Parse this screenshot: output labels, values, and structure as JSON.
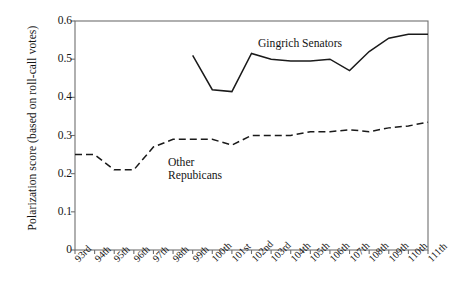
{
  "chart_data": {
    "type": "line",
    "title": "",
    "subtitle": "",
    "xlabel": "",
    "ylabel": "Polarization score (based on roll-call votes)",
    "categories": [
      "93rd",
      "94th",
      "95th",
      "96th",
      "97th",
      "98th",
      "99th",
      "100th",
      "101st",
      "102nd",
      "103rd",
      "104th",
      "105th",
      "106th",
      "107th",
      "108th",
      "109th",
      "110th",
      "111th"
    ],
    "ylim": [
      0,
      0.6
    ],
    "ytick_labels": [
      "0",
      "0.1",
      "0.2",
      "0.3",
      "0.4",
      "0.5",
      "0.6"
    ],
    "ytick_values": [
      0,
      0.1,
      0.2,
      0.3,
      0.4,
      0.5,
      0.6
    ],
    "grid": false,
    "legend_position": "inline-annotation",
    "series": [
      {
        "name": "Gingrich Senators",
        "style": "solid",
        "color": "#1a1a1a",
        "start_category": "99th",
        "x": [
          "99th",
          "100th",
          "101st",
          "102nd",
          "103rd",
          "104th",
          "105th",
          "106th",
          "107th",
          "108th",
          "109th",
          "110th",
          "111th"
        ],
        "values": [
          0.51,
          0.42,
          0.415,
          0.515,
          0.5,
          0.495,
          0.495,
          0.5,
          0.47,
          0.52,
          0.555,
          0.565,
          0.565
        ]
      },
      {
        "name": "Other Repubicans",
        "style": "dashed",
        "color": "#1a1a1a",
        "start_category": "93rd",
        "x": [
          "93rd",
          "94th",
          "95th",
          "96th",
          "97th",
          "98th",
          "99th",
          "100th",
          "101st",
          "102nd",
          "103rd",
          "104th",
          "105th",
          "106th",
          "107th",
          "108th",
          "109th",
          "110th",
          "111th"
        ],
        "values": [
          0.25,
          0.25,
          0.21,
          0.21,
          0.27,
          0.29,
          0.29,
          0.29,
          0.275,
          0.3,
          0.3,
          0.3,
          0.31,
          0.31,
          0.315,
          0.31,
          0.32,
          0.325,
          0.335
        ]
      }
    ],
    "annotations": [
      {
        "name": "gingrich-senators-label",
        "text": "Gingrich Senators"
      },
      {
        "name": "other-republicans-label-line1",
        "text": "Other"
      },
      {
        "name": "other-republicans-label-line2",
        "text": "Repubicans"
      }
    ]
  },
  "axes": {
    "plot_left_px": 75,
    "plot_right_px": 428,
    "plot_top_px": 21,
    "plot_bottom_px": 250,
    "frame_color": "#6f6f6f"
  }
}
